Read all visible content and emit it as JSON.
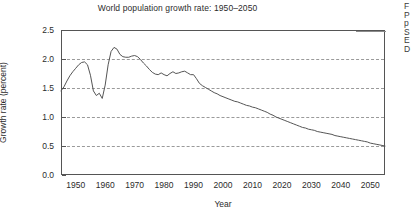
{
  "figure": {
    "title": "World population growth rate: 1950–2050",
    "x_axis_title": "Year",
    "y_axis_title": "Growth rate (percent)"
  },
  "side_text_fragment": {
    "lines": [
      "F",
      "P",
      "p",
      "S",
      "E",
      "D"
    ]
  },
  "chart_data": {
    "type": "line",
    "title": "World population growth rate: 1950–2050",
    "xlabel": "Year",
    "ylabel": "Growth rate (percent)",
    "xlim": [
      1945,
      2055
    ],
    "ylim": [
      0.0,
      2.5
    ],
    "xticks": [
      1950,
      1960,
      1970,
      1980,
      1990,
      2000,
      2010,
      2020,
      2030,
      2040,
      2050
    ],
    "yticks": [
      0.0,
      0.5,
      1.0,
      1.5,
      2.0,
      2.5
    ],
    "ytick_labels": [
      "0.0",
      "0.5",
      "1.0",
      "1.5",
      "2.0",
      "2.5"
    ],
    "grid": "horizontal-dashed",
    "legend": "none",
    "line_color": "#555555",
    "series": [
      {
        "name": "World population growth rate",
        "x": [
          1945,
          1946,
          1947,
          1948,
          1949,
          1950,
          1951,
          1952,
          1953,
          1954,
          1955,
          1956,
          1957,
          1958,
          1959,
          1960,
          1961,
          1962,
          1963,
          1964,
          1965,
          1966,
          1967,
          1968,
          1969,
          1970,
          1971,
          1972,
          1973,
          1974,
          1975,
          1976,
          1977,
          1978,
          1979,
          1980,
          1981,
          1982,
          1983,
          1984,
          1985,
          1986,
          1987,
          1988,
          1989,
          1990,
          1991,
          1992,
          1993,
          1994,
          1995,
          1996,
          1997,
          1998,
          1999,
          2000,
          2001,
          2002,
          2003,
          2004,
          2005,
          2006,
          2007,
          2008,
          2009,
          2010,
          2011,
          2012,
          2013,
          2014,
          2015,
          2016,
          2017,
          2018,
          2019,
          2020,
          2021,
          2022,
          2023,
          2024,
          2025,
          2026,
          2027,
          2028,
          2029,
          2030,
          2031,
          2032,
          2033,
          2034,
          2035,
          2036,
          2037,
          2038,
          2039,
          2040,
          2041,
          2042,
          2043,
          2044,
          2045,
          2046,
          2047,
          2048,
          2049,
          2050,
          2051,
          2052,
          2053,
          2054,
          2055
        ],
        "y": [
          1.45,
          1.52,
          1.62,
          1.71,
          1.78,
          1.84,
          1.9,
          1.94,
          1.95,
          1.9,
          1.72,
          1.45,
          1.37,
          1.41,
          1.32,
          1.55,
          1.9,
          2.13,
          2.2,
          2.17,
          2.08,
          2.04,
          2.03,
          2.03,
          2.05,
          2.06,
          2.04,
          1.99,
          1.93,
          1.88,
          1.82,
          1.77,
          1.74,
          1.73,
          1.76,
          1.73,
          1.71,
          1.75,
          1.78,
          1.75,
          1.76,
          1.78,
          1.79,
          1.76,
          1.73,
          1.73,
          1.66,
          1.58,
          1.54,
          1.51,
          1.48,
          1.45,
          1.42,
          1.4,
          1.37,
          1.35,
          1.33,
          1.31,
          1.29,
          1.27,
          1.26,
          1.24,
          1.22,
          1.2,
          1.19,
          1.17,
          1.16,
          1.14,
          1.12,
          1.1,
          1.08,
          1.05,
          1.03,
          1.0,
          0.98,
          0.96,
          0.94,
          0.92,
          0.9,
          0.88,
          0.86,
          0.84,
          0.82,
          0.81,
          0.79,
          0.78,
          0.77,
          0.75,
          0.74,
          0.73,
          0.72,
          0.71,
          0.7,
          0.68,
          0.67,
          0.66,
          0.65,
          0.64,
          0.63,
          0.62,
          0.61,
          0.6,
          0.59,
          0.58,
          0.57,
          0.55,
          0.54,
          0.53,
          0.52,
          0.51,
          0.5
        ]
      }
    ]
  }
}
